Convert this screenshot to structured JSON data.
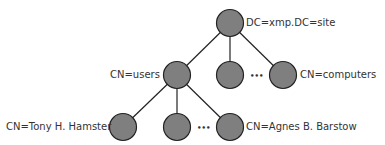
{
  "diagram": {
    "type": "ldap-directory-tree",
    "colors": {
      "node_fill": "#7f7f7f",
      "node_stroke": "#222222",
      "edge": "#222222",
      "text": "#333333"
    },
    "nodes": [
      {
        "id": "root",
        "label": "DC=xmp.DC=site",
        "x": 230,
        "y": 23
      },
      {
        "id": "users",
        "label": "CN=users",
        "x": 177,
        "y": 75
      },
      {
        "id": "mid2",
        "label": "",
        "x": 230,
        "y": 75
      },
      {
        "id": "computers",
        "label": "CN=computers",
        "x": 283,
        "y": 75
      },
      {
        "id": "tony",
        "label": "CN=Tony H. Hamster",
        "x": 123,
        "y": 127
      },
      {
        "id": "mid3",
        "label": "",
        "x": 177,
        "y": 127
      },
      {
        "id": "agnes",
        "label": "CN=Agnes B. Barstow",
        "x": 230,
        "y": 127
      }
    ],
    "edges": [
      [
        "root",
        "users"
      ],
      [
        "root",
        "mid2"
      ],
      [
        "root",
        "computers"
      ],
      [
        "users",
        "tony"
      ],
      [
        "users",
        "mid3"
      ],
      [
        "users",
        "agnes"
      ]
    ],
    "ellipsis": "•••"
  }
}
